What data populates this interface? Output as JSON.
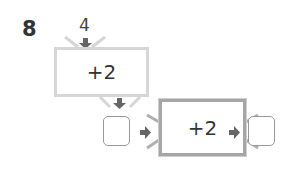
{
  "problem_number": "8",
  "input_value": "4",
  "machines": [
    {
      "operation": "+2"
    },
    {
      "operation": "+2"
    }
  ],
  "answer_boxes": [
    {
      "value": ""
    },
    {
      "value": ""
    }
  ],
  "colors": {
    "machine1_border": "#d6d6d6",
    "machine2_border": "#a6a6a6",
    "arrow": "#666666"
  }
}
